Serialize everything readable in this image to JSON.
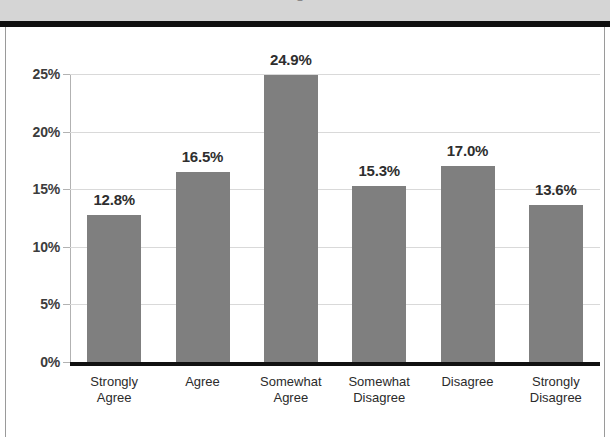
{
  "header": {
    "band_color": "#d5d5d5",
    "rule_color": "#0f0f0f",
    "cropped_title": "Figure"
  },
  "chart_data": {
    "type": "bar",
    "title": "",
    "subtitle": "",
    "xlabel": "",
    "ylabel": "",
    "categories": [
      "Strongly\nAgree",
      "Agree",
      "Somewhat\nAgree",
      "Somewhat\nDisagree",
      "Disagree",
      "Strongly\nDisagree"
    ],
    "values": [
      12.8,
      16.5,
      24.9,
      15.3,
      17.0,
      13.6
    ],
    "data_labels": [
      "12.8%",
      "16.5%",
      "24.9%",
      "15.3%",
      "17.0%",
      "13.6%"
    ],
    "ylim": [
      0,
      25
    ],
    "ytick_values": [
      0,
      5,
      10,
      15,
      20,
      25
    ],
    "ytick_labels": [
      "0%",
      "5%",
      "10%",
      "15%",
      "20%",
      "25%"
    ],
    "grid": true,
    "grid_axis": "y",
    "legend": false,
    "legend_position": "none",
    "bar_color": "#7f7f7f",
    "label_color": "#2e2e2e",
    "gridline_color": "#d9d9d9",
    "axis_color": "#111111"
  }
}
